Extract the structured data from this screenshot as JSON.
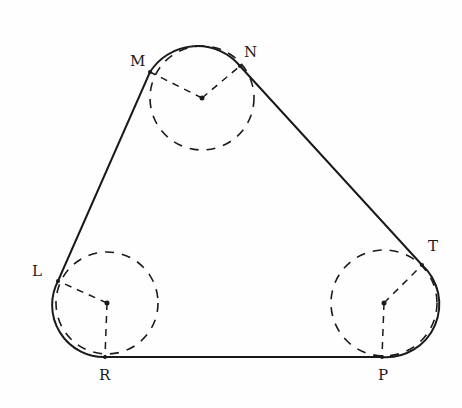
{
  "diagram": {
    "type": "belt-around-three-pulleys",
    "labels": {
      "M": "M",
      "N": "N",
      "L": "L",
      "R": "R",
      "T": "T",
      "P": "P"
    },
    "circles": [
      {
        "name": "top",
        "cx": 202,
        "cy": 98,
        "r": 52
      },
      {
        "name": "left",
        "cx": 107,
        "cy": 303,
        "r": 51
      },
      {
        "name": "right",
        "cx": 384,
        "cy": 303,
        "r": 53
      }
    ],
    "tangent_points": {
      "M": [
        150,
        72
      ],
      "N": [
        240,
        66
      ],
      "L": [
        58,
        281
      ],
      "R": [
        105,
        357
      ],
      "T": [
        422,
        265
      ],
      "P": [
        382,
        357
      ]
    },
    "colors": {
      "stroke": "#1a1a1a",
      "background": "#fefefe"
    }
  }
}
